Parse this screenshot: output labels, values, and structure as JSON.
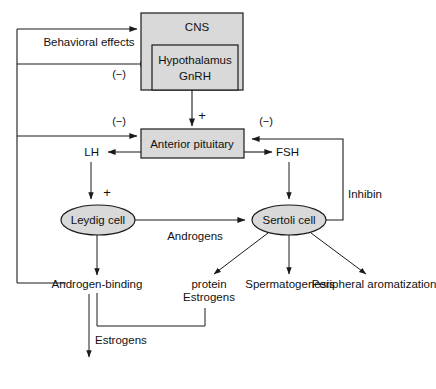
{
  "diagram": {
    "type": "flow-diagram",
    "colors": {
      "node_fill": "#d9d9d9",
      "stroke": "#1a1a1a",
      "background": "#ffffff",
      "text": "#111111"
    },
    "nodes": [
      {
        "id": "cns",
        "label": "CNS",
        "shape": "rect",
        "x": 141,
        "y": 13,
        "w": 102,
        "h": 77
      },
      {
        "id": "hypothalamus",
        "label_line1": "Hypothalamus",
        "label_line2": "GnRH",
        "shape": "rect",
        "x": 152,
        "y": 45,
        "w": 86,
        "h": 45
      },
      {
        "id": "anterior-pituitary",
        "label": "Anterior pituitary",
        "shape": "rect",
        "x": 141,
        "y": 129,
        "w": 103,
        "h": 29
      },
      {
        "id": "leydig-cell",
        "label": "Leydig cell",
        "shape": "ellipse",
        "cx": 98,
        "cy": 220,
        "rx": 37,
        "ry": 15
      },
      {
        "id": "sertoli-cell",
        "label": "Sertoli cell",
        "shape": "ellipse",
        "cx": 289,
        "cy": 220,
        "rx": 37,
        "ry": 15
      }
    ],
    "text_labels": [
      {
        "id": "behavioral-effects",
        "text": "Behavioral effects",
        "x": 89,
        "y": 44
      },
      {
        "id": "lh",
        "text": "LH",
        "x": 91,
        "y": 154
      },
      {
        "id": "fsh",
        "text": "FSH",
        "x": 281,
        "y": 154
      },
      {
        "id": "inhibin",
        "text": "Inhibin",
        "x": 351,
        "y": 194
      },
      {
        "id": "androgens-mid",
        "text": "Androgens",
        "x": 195,
        "y": 236
      },
      {
        "id": "androgens-bottom",
        "text": "Androgens",
        "x": 97,
        "y": 288
      },
      {
        "id": "androgen-binding-protein-1",
        "text": "Androgen-binding",
        "x": 209,
        "y": 288
      },
      {
        "id": "androgen-binding-protein-2",
        "text": "protein",
        "x": 209,
        "y": 301
      },
      {
        "id": "estrogens-sertoli",
        "text": "Estrogens",
        "x": 290,
        "y": 288
      },
      {
        "id": "spermatogenesis",
        "text": "Spermatogenesis",
        "x": 374,
        "y": 288
      },
      {
        "id": "peripheral-aromatization",
        "text": "Peripheral aromatization",
        "x": 162,
        "y": 340
      },
      {
        "id": "estrogens-peripheral",
        "text": "Estrogens",
        "x": 92,
        "y": 372
      }
    ],
    "sign_labels": [
      {
        "id": "minus-hypothalamus",
        "text": "(−)",
        "x": 119,
        "y": 76
      },
      {
        "id": "minus-pituitary-left",
        "text": "(−)",
        "x": 119,
        "y": 122
      },
      {
        "id": "minus-pituitary-right",
        "text": "(−)",
        "x": 266,
        "y": 122
      },
      {
        "id": "plus-pituitary",
        "text": "+",
        "x": 201,
        "y": 118
      },
      {
        "id": "plus-leydig",
        "text": "+",
        "x": 107,
        "y": 194
      }
    ],
    "edges": [
      {
        "id": "hypothalamus-to-pituitary",
        "from": "hypothalamus",
        "to": "anterior-pituitary",
        "sign": "+"
      },
      {
        "id": "pituitary-to-lh",
        "from": "anterior-pituitary",
        "to": "lh"
      },
      {
        "id": "pituitary-to-fsh",
        "from": "anterior-pituitary",
        "to": "fsh"
      },
      {
        "id": "lh-to-leydig",
        "from": "lh",
        "to": "leydig-cell",
        "sign": "+"
      },
      {
        "id": "fsh-to-sertoli",
        "from": "fsh",
        "to": "sertoli-cell"
      },
      {
        "id": "leydig-to-sertoli",
        "from": "leydig-cell",
        "to": "sertoli-cell",
        "label": "Androgens"
      },
      {
        "id": "leydig-to-androgens",
        "from": "leydig-cell",
        "to": "androgens-bottom"
      },
      {
        "id": "sertoli-to-abp",
        "from": "sertoli-cell",
        "to": "androgen-binding-protein"
      },
      {
        "id": "sertoli-to-estrogens",
        "from": "sertoli-cell",
        "to": "estrogens-sertoli"
      },
      {
        "id": "sertoli-to-spermatogenesis",
        "from": "sertoli-cell",
        "to": "spermatogenesis"
      },
      {
        "id": "sertoli-inhibin-to-pituitary",
        "from": "sertoli-cell",
        "to": "anterior-pituitary",
        "label": "Inhibin",
        "sign": "(−)"
      },
      {
        "id": "androgens-feedback-to-cns",
        "from": "androgens-bottom",
        "to": "cns",
        "label": "Behavioral effects"
      },
      {
        "id": "androgens-feedback-to-hypothalamus",
        "from": "androgens-bottom",
        "to": "hypothalamus",
        "sign": "(−)"
      },
      {
        "id": "androgens-feedback-to-pituitary",
        "from": "androgens-bottom",
        "to": "anterior-pituitary",
        "sign": "(−)"
      },
      {
        "id": "androgens-to-estrogens-peripheral",
        "from": "androgens-bottom",
        "to": "estrogens-peripheral",
        "label": "Peripheral aromatization"
      }
    ]
  }
}
